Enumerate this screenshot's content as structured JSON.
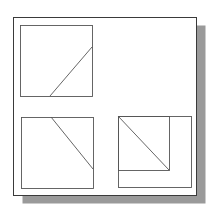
{
  "diagram": {
    "colors": {
      "background": "#ffffff",
      "frame_stroke": "#3a3a3a",
      "line_stroke": "#555555",
      "shadow": "#9a9a9a"
    },
    "frame": {
      "x": 13,
      "y": 17,
      "w": 183,
      "h": 178
    },
    "shadow": {
      "dx": 9,
      "dy": 8
    },
    "views": [
      {
        "name": "top-left-view",
        "square": {
          "x": 20,
          "y": 25,
          "w": 72,
          "h": 71
        },
        "diagonal": {
          "x1": 50,
          "y1": 96,
          "x2": 92,
          "y2": 47
        }
      },
      {
        "name": "bottom-left-view",
        "square": {
          "x": 21,
          "y": 117,
          "w": 72,
          "h": 71
        },
        "diagonal": {
          "x1": 51,
          "y1": 117,
          "x2": 93,
          "y2": 169
        }
      },
      {
        "name": "bottom-right-view",
        "square": {
          "x": 118,
          "y": 116,
          "w": 73,
          "h": 71
        },
        "inner_square": {
          "x": 118,
          "y": 116,
          "w": 51,
          "h": 54
        },
        "diagonal": {
          "x1": 118,
          "y1": 116,
          "x2": 169,
          "y2": 170
        }
      }
    ]
  }
}
